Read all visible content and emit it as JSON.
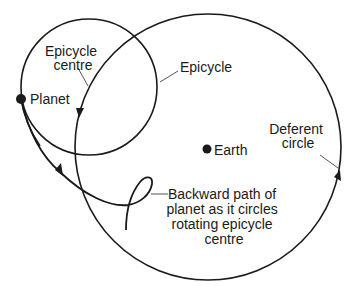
{
  "diagram": {
    "labels": {
      "epicycle_centre": [
        "Epicycle",
        "centre"
      ],
      "epicycle": "Epicycle",
      "planet": "Planet",
      "earth": "Earth",
      "deferent": [
        "Deferent",
        "circle"
      ],
      "backward_path": [
        "Backward path of",
        "planet as it circles",
        "rotating epicycle",
        "centre"
      ]
    },
    "colors": {
      "stroke": "#1a1a1a",
      "leader": "#555555",
      "background": "#ffffff"
    }
  }
}
